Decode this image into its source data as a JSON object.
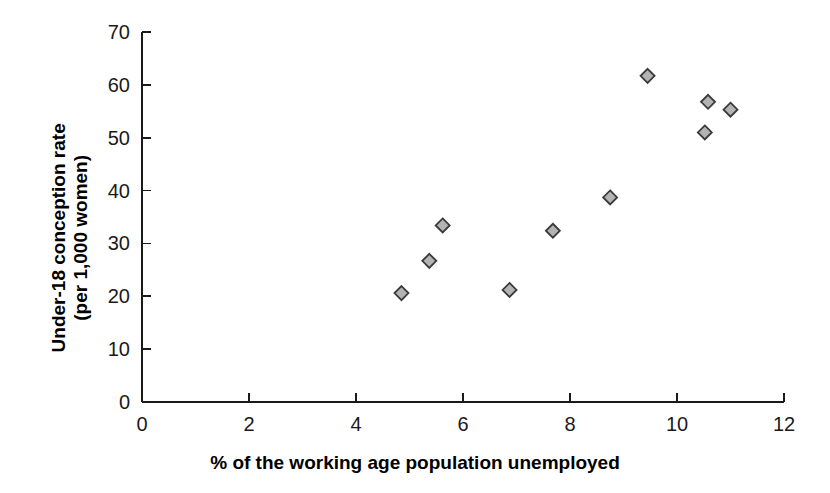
{
  "chart_data": {
    "type": "scatter",
    "title": "",
    "xlabel": "% of the working age population unemployed",
    "ylabel": "Under-18 conception rate (per 1,000 women)",
    "ylabel_line1": "Under-18 conception rate",
    "ylabel_line2": "(per 1,000 women)",
    "xlim": [
      0,
      12
    ],
    "ylim": [
      0,
      70
    ],
    "xticks": [
      0,
      2,
      4,
      6,
      8,
      10,
      12
    ],
    "yticks": [
      0,
      10,
      20,
      30,
      40,
      50,
      60,
      70
    ],
    "xtick_labels": [
      "0",
      "2",
      "4",
      "6",
      "8",
      "10",
      "12"
    ],
    "ytick_labels": [
      "0",
      "10",
      "20",
      "30",
      "40",
      "50",
      "60",
      "70"
    ],
    "grid": false,
    "legend": "none",
    "marker": {
      "shape": "diamond",
      "fill": "#b3b3b3",
      "edge": "#3a3a3a",
      "size": 11
    },
    "axis_color": "#1a1a1a",
    "background": "#ffffff",
    "points": [
      {
        "x": 4.85,
        "y": 20.6
      },
      {
        "x": 5.37,
        "y": 26.7
      },
      {
        "x": 5.62,
        "y": 33.4
      },
      {
        "x": 6.87,
        "y": 21.2
      },
      {
        "x": 7.68,
        "y": 32.4
      },
      {
        "x": 8.75,
        "y": 38.7
      },
      {
        "x": 9.45,
        "y": 61.7
      },
      {
        "x": 10.52,
        "y": 51.0
      },
      {
        "x": 10.58,
        "y": 56.8
      },
      {
        "x": 11.0,
        "y": 55.3
      }
    ]
  }
}
